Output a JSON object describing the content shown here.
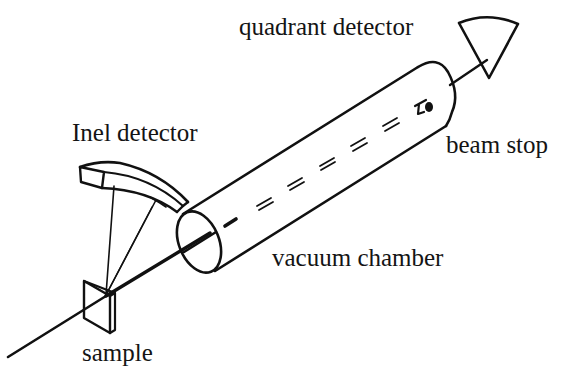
{
  "diagram": {
    "type": "experimental-setup schematic",
    "labels": {
      "quadrant_detector": "quadrant detector",
      "inel_detector": "Inel detector",
      "beam_stop": "beam stop",
      "vacuum_chamber": "vacuum chamber",
      "sample": "sample"
    },
    "components": [
      {
        "id": "beam",
        "description": "incident beam line passing through sample and vacuum chamber"
      },
      {
        "id": "sample",
        "description": "flat sample plate"
      },
      {
        "id": "inel_detector",
        "description": "curved position-sensitive detector above sample"
      },
      {
        "id": "vacuum_chamber",
        "description": "cylindrical tube along beam direction"
      },
      {
        "id": "beam_stop",
        "description": "small stop at far end inside chamber"
      },
      {
        "id": "quadrant_detector",
        "description": "fan-shaped detector at end of beam"
      }
    ],
    "colors": {
      "line": "#111111",
      "text": "#141414",
      "background": "#ffffff"
    }
  }
}
